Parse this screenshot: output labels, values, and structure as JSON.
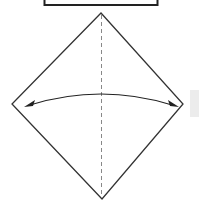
{
  "diagram": {
    "type": "origami-fold-step",
    "shape": "square rotated 45 degrees (diamond)",
    "crease": "vertical dashed valley-fold line through center",
    "arrow": "curved double-headed arrow from left corner to right corner",
    "colors": {
      "stroke": "#333333",
      "crease": "#888888",
      "background": "#ffffff",
      "side_tab": "#ececec"
    }
  }
}
